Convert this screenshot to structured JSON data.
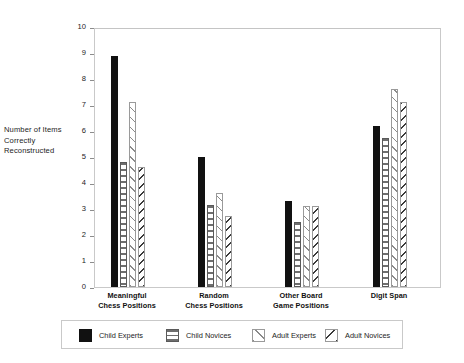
{
  "chart_data": {
    "type": "bar",
    "title": "",
    "xlabel": "",
    "ylabel": "Number of Items\nCorrectly\nReconstructed",
    "ylabel_lines": [
      "Number of Items",
      "Correctly",
      "Reconstructed"
    ],
    "ylim": [
      0,
      10
    ],
    "ytick_step": 1,
    "yticks": [
      0,
      1,
      2,
      3,
      4,
      5,
      6,
      7,
      8,
      9,
      10
    ],
    "ytick_labels": [
      "0",
      "1",
      "2",
      "3",
      "4",
      "5",
      "6",
      "7",
      "8",
      "9",
      "10"
    ],
    "grid": false,
    "legend_position": "bottom",
    "categories": [
      "Meaningful\nChess Positions",
      "Random\nChess Positions",
      "Other Board\nGame Positions",
      "Digit Span"
    ],
    "category_lines": [
      [
        "Meaningful",
        "Chess Positions"
      ],
      [
        "Random",
        "Chess Positions"
      ],
      [
        "Other Board",
        "Game Positions"
      ],
      [
        "Digit Span",
        ""
      ]
    ],
    "series": [
      {
        "name": "Child Experts",
        "pattern": "solid-black",
        "values": [
          8.9,
          5.0,
          3.3,
          6.2
        ]
      },
      {
        "name": "Child Novices",
        "pattern": "horizontal-lines",
        "values": [
          4.8,
          3.15,
          2.5,
          5.75
        ]
      },
      {
        "name": "Adult Experts",
        "pattern": "diagonal-forward",
        "values": [
          7.1,
          3.6,
          3.1,
          7.6
        ]
      },
      {
        "name": "Adult Novices",
        "pattern": "diagonal-back",
        "values": [
          4.6,
          2.75,
          3.1,
          7.1
        ]
      }
    ]
  },
  "legend": {
    "items": [
      {
        "label": "Child Experts"
      },
      {
        "label": "Child Novices"
      },
      {
        "label": "Adult Experts"
      },
      {
        "label": "Adult Novices"
      }
    ]
  },
  "colors": {
    "series_child_experts": "#111111",
    "series_child_novices": "#6e6e6e",
    "series_adult_experts": "#8a8a8a",
    "series_adult_novices": "#3a3a3a",
    "frame": "#c9c9c9",
    "text": "#1d1d1d",
    "background": "#ffffff"
  }
}
